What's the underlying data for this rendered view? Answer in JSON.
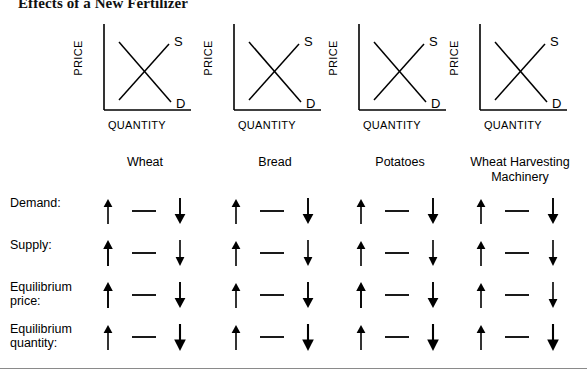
{
  "title": "Effects of a New Fertilizer",
  "graph": {
    "y_axis_label": "PRICE",
    "x_axis_label": "QUANTITY",
    "supply_label": "S",
    "demand_label": "D"
  },
  "columns": [
    {
      "caption": "Wheat",
      "caption_line2": ""
    },
    {
      "caption": "Bread",
      "caption_line2": ""
    },
    {
      "caption": "Potatoes",
      "caption_line2": ""
    },
    {
      "caption": "Wheat Harvesting",
      "caption_line2": "Machinery"
    }
  ],
  "rows": [
    {
      "label_line1": "Demand:",
      "label_line2": ""
    },
    {
      "label_line1": "Supply:",
      "label_line2": ""
    },
    {
      "label_line1": "Equilibrium",
      "label_line2": "price:"
    },
    {
      "label_line1": "Equilibrium",
      "label_line2": "quantity:"
    }
  ],
  "glyph_options": [
    {
      "name": "up-arrow",
      "symbol": "increase"
    },
    {
      "name": "dash",
      "symbol": "no-change"
    },
    {
      "name": "down-arrow",
      "symbol": "decrease"
    }
  ],
  "colors": {
    "ink": "#000000",
    "rule": "#8a8a8a",
    "title": "#111111"
  }
}
